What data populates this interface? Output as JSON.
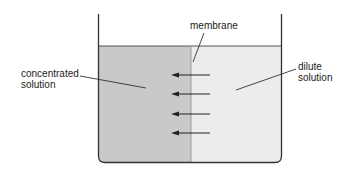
{
  "diagram": {
    "labels": {
      "membrane": "membrane",
      "concentrated_line1": "concentrated",
      "concentrated_line2": "solution",
      "dilute_line1": "dilute",
      "dilute_line2": "solution"
    },
    "colors": {
      "concentrated_fill": "#c9c9c9",
      "dilute_fill": "#ececec",
      "outline": "#333333",
      "arrow": "#222222"
    },
    "arrows": {
      "count": 4,
      "direction": "left",
      "meaning": "water flows from dilute solution to concentrated solution"
    }
  }
}
